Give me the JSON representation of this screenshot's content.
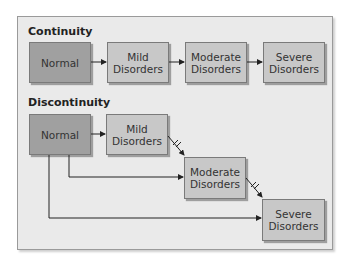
{
  "continuity": {
    "title": "Continuity",
    "boxes": [
      {
        "label": "Normal"
      },
      {
        "label": "Mild Disorders"
      },
      {
        "label": "Moderate Disorders"
      },
      {
        "label": "Severe Disorders"
      }
    ]
  },
  "discontinuity": {
    "title": "Discontinuity",
    "boxes": [
      {
        "label": "Normal"
      },
      {
        "label": "Mild Disorders"
      },
      {
        "label": "Moderate Disorders"
      },
      {
        "label": "Severe Disorders"
      }
    ]
  },
  "colors": {
    "frame_bg": "#eaeaea",
    "normal_box": "#a0a0a0",
    "disorder_box": "#c8c8c8",
    "arrow": "#222222"
  }
}
